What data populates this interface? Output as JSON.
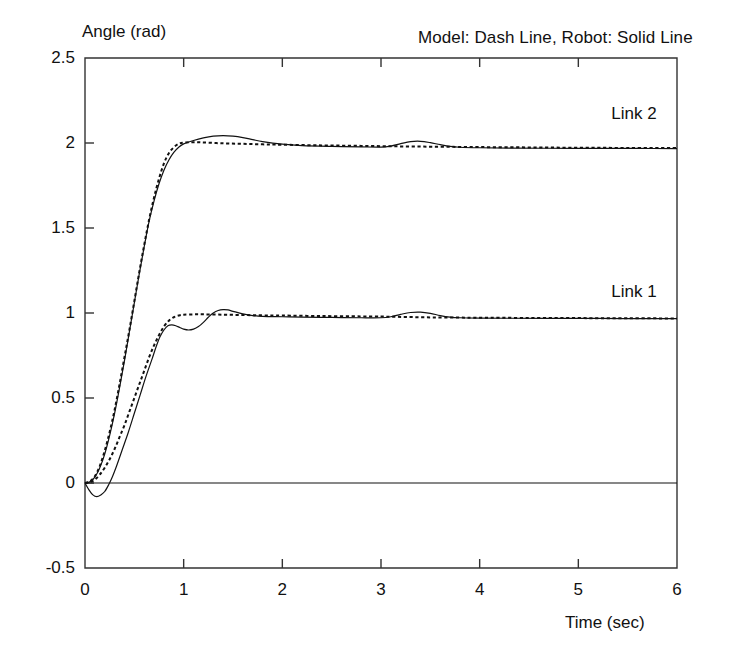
{
  "chart_data": {
    "type": "line",
    "title": "",
    "annotation": "Model: Dash Line, Robot: Solid Line",
    "xlabel": "Time (sec)",
    "ylabel": "Angle (rad)",
    "xlim": [
      0,
      6
    ],
    "ylim": [
      -0.5,
      2.5
    ],
    "xticks": [
      "0",
      "1",
      "2",
      "3",
      "4",
      "5",
      "6"
    ],
    "xtick_values": [
      0,
      1,
      2,
      3,
      4,
      5,
      6
    ],
    "yticks": [
      "-0.5",
      "0",
      "0.5",
      "1",
      "1.5",
      "2",
      "2.5"
    ],
    "ytick_values": [
      -0.5,
      0,
      0.5,
      1,
      1.5,
      2,
      2.5
    ],
    "grid": false,
    "zero_reference_line": 0,
    "legend_position": "inline-annotations",
    "series_labels": {
      "link1": "Link 1",
      "link2": "Link 2"
    },
    "series": [
      {
        "name": "Link 1 Model (Dash Line)",
        "style": "dashed",
        "color": "#111111",
        "label": "Link 1",
        "x": [
          0.0,
          0.05,
          0.1,
          0.15,
          0.2,
          0.25,
          0.3,
          0.35,
          0.4,
          0.45,
          0.5,
          0.55,
          0.6,
          0.65,
          0.7,
          0.75,
          0.8,
          0.85,
          0.9,
          0.95,
          1.0,
          1.1,
          1.2,
          1.4,
          1.6,
          1.8,
          2.0,
          2.4,
          2.8,
          3.0,
          3.1,
          3.2,
          3.3,
          3.4,
          3.5,
          3.6,
          3.8,
          4.0,
          4.5,
          5.0,
          5.5,
          6.0
        ],
        "y": [
          0.0,
          0.005,
          0.02,
          0.05,
          0.09,
          0.14,
          0.2,
          0.27,
          0.34,
          0.42,
          0.5,
          0.58,
          0.66,
          0.74,
          0.81,
          0.87,
          0.92,
          0.955,
          0.975,
          0.985,
          0.99,
          0.992,
          0.992,
          0.99,
          0.988,
          0.986,
          0.985,
          0.982,
          0.98,
          0.979,
          0.978,
          0.977,
          0.976,
          0.975,
          0.974,
          0.974,
          0.973,
          0.972,
          0.971,
          0.97,
          0.969,
          0.968
        ]
      },
      {
        "name": "Link 1 Robot (Solid Line)",
        "style": "solid",
        "color": "#111111",
        "label": "Link 1",
        "x": [
          0.0,
          0.04,
          0.08,
          0.12,
          0.16,
          0.2,
          0.24,
          0.28,
          0.32,
          0.38,
          0.44,
          0.5,
          0.56,
          0.62,
          0.68,
          0.72,
          0.76,
          0.8,
          0.84,
          0.88,
          0.92,
          0.96,
          1.0,
          1.05,
          1.1,
          1.15,
          1.2,
          1.25,
          1.3,
          1.35,
          1.4,
          1.45,
          1.5,
          1.6,
          1.7,
          1.8,
          2.0,
          2.2,
          2.5,
          2.8,
          3.0,
          3.1,
          3.2,
          3.3,
          3.4,
          3.5,
          3.6,
          3.7,
          3.8,
          4.0,
          4.3,
          4.7,
          5.2,
          5.6,
          6.0
        ],
        "y": [
          0.0,
          -0.04,
          -0.07,
          -0.08,
          -0.07,
          -0.05,
          -0.01,
          0.04,
          0.1,
          0.2,
          0.3,
          0.41,
          0.52,
          0.63,
          0.73,
          0.8,
          0.86,
          0.9,
          0.925,
          0.93,
          0.925,
          0.915,
          0.905,
          0.9,
          0.905,
          0.92,
          0.945,
          0.975,
          1.0,
          1.015,
          1.02,
          1.018,
          1.01,
          0.995,
          0.985,
          0.98,
          0.978,
          0.976,
          0.974,
          0.972,
          0.972,
          0.978,
          0.992,
          1.003,
          1.005,
          0.998,
          0.985,
          0.976,
          0.972,
          0.97,
          0.969,
          0.968,
          0.968,
          0.967,
          0.967
        ]
      },
      {
        "name": "Link 2 Model (Dash Line)",
        "style": "dashed",
        "color": "#111111",
        "label": "Link 2",
        "x": [
          0.0,
          0.05,
          0.1,
          0.15,
          0.2,
          0.25,
          0.3,
          0.35,
          0.4,
          0.45,
          0.5,
          0.55,
          0.6,
          0.65,
          0.7,
          0.75,
          0.8,
          0.85,
          0.9,
          0.95,
          1.0,
          1.1,
          1.2,
          1.4,
          1.6,
          1.8,
          2.0,
          2.4,
          2.8,
          3.2,
          3.6,
          4.0,
          4.5,
          5.0,
          5.5,
          6.0
        ],
        "y": [
          0.0,
          0.01,
          0.04,
          0.1,
          0.19,
          0.3,
          0.43,
          0.58,
          0.74,
          0.9,
          1.07,
          1.24,
          1.4,
          1.55,
          1.68,
          1.79,
          1.88,
          1.94,
          1.975,
          1.995,
          2.002,
          2.005,
          2.003,
          1.998,
          1.995,
          1.992,
          1.99,
          1.986,
          1.983,
          1.98,
          1.978,
          1.976,
          1.974,
          1.972,
          1.971,
          1.97
        ]
      },
      {
        "name": "Link 2 Robot (Solid Line)",
        "style": "solid",
        "color": "#111111",
        "label": "Link 2",
        "x": [
          0.0,
          0.05,
          0.1,
          0.15,
          0.2,
          0.25,
          0.3,
          0.35,
          0.4,
          0.45,
          0.5,
          0.55,
          0.6,
          0.65,
          0.7,
          0.75,
          0.8,
          0.85,
          0.9,
          0.95,
          1.0,
          1.1,
          1.2,
          1.3,
          1.4,
          1.5,
          1.6,
          1.7,
          1.8,
          2.0,
          2.2,
          2.5,
          2.8,
          3.0,
          3.1,
          3.2,
          3.3,
          3.4,
          3.5,
          3.6,
          3.7,
          3.8,
          4.0,
          4.3,
          4.7,
          5.2,
          5.6,
          6.0
        ],
        "y": [
          0.0,
          0.008,
          0.035,
          0.09,
          0.17,
          0.28,
          0.41,
          0.56,
          0.72,
          0.89,
          1.06,
          1.23,
          1.39,
          1.54,
          1.66,
          1.76,
          1.84,
          1.9,
          1.945,
          1.975,
          1.995,
          2.015,
          2.03,
          2.04,
          2.043,
          2.04,
          2.032,
          2.02,
          2.008,
          1.993,
          1.985,
          1.98,
          1.977,
          1.976,
          1.982,
          1.996,
          2.008,
          2.01,
          2.002,
          1.99,
          1.98,
          1.975,
          1.972,
          1.97,
          1.969,
          1.968,
          1.968,
          1.967
        ]
      }
    ]
  },
  "axes": {
    "y_title": "Angle (rad)",
    "x_title": "Time (sec)"
  },
  "annotations": {
    "legend_note": "Model: Dash Line, Robot: Solid Line",
    "link2_label": "Link 2",
    "link1_label": "Link 1"
  },
  "colors": {
    "line": "#111111",
    "frame": "#333333",
    "background": "#ffffff"
  }
}
